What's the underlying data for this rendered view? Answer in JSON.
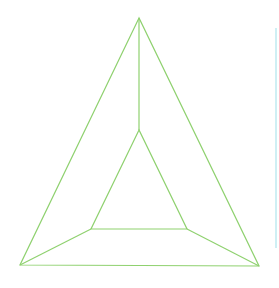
{
  "diagram": {
    "type": "truncated-pyramid-top-view",
    "stroke_color": "#8fd16f",
    "edge_line_color": "#bfeaf0",
    "outer_triangle": [
      [
        139,
        18
      ],
      [
        20,
        265
      ],
      [
        259,
        266
      ]
    ],
    "inner_triangle": [
      [
        139,
        130
      ],
      [
        91,
        229
      ],
      [
        187,
        229
      ]
    ],
    "connectors": [
      [
        [
          139,
          18
        ],
        [
          139,
          130
        ]
      ],
      [
        [
          20,
          265
        ],
        [
          91,
          229
        ]
      ],
      [
        [
          259,
          266
        ],
        [
          187,
          229
        ]
      ]
    ],
    "right_edge_line": [
      [
        276,
        28
      ],
      [
        276,
        248
      ]
    ]
  }
}
